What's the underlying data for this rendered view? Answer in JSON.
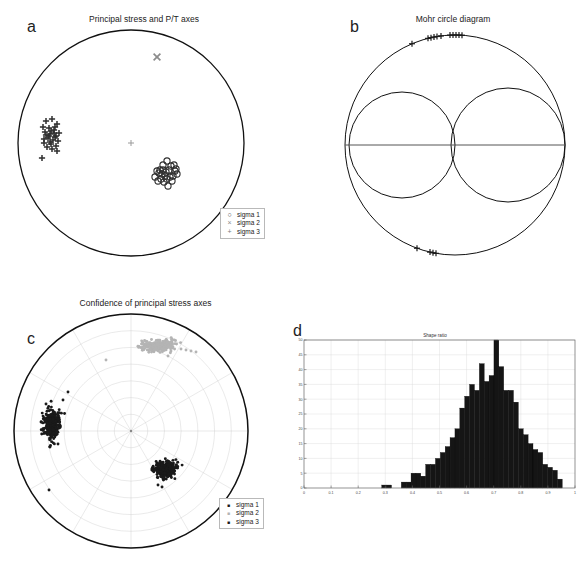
{
  "figure": {
    "panels": [
      {
        "letter": "a",
        "title": "Principal stress and P/T axes"
      },
      {
        "letter": "b",
        "title": "Mohr circle diagram"
      },
      {
        "letter": "c",
        "title": "Confidence of principal stress axes"
      },
      {
        "letter": "d",
        "title": "Shape ratio"
      }
    ]
  },
  "legend_a": {
    "items": [
      {
        "symbol": "○",
        "label": "sigma 1",
        "color": "#3a3a3a"
      },
      {
        "symbol": "×",
        "label": "sigma 2",
        "color": "#8c8c8c"
      },
      {
        "symbol": "+",
        "label": "sigma 3",
        "color": "#7a7a7a"
      }
    ]
  },
  "legend_c": {
    "items": [
      {
        "symbol": "■",
        "label": "sigma 1",
        "color": "#1a1a1a"
      },
      {
        "symbol": "■",
        "label": "sigma 2",
        "color": "#b4b4b4"
      },
      {
        "symbol": "■",
        "label": "sigma 3",
        "color": "#1a1a1a"
      }
    ]
  },
  "chart_data": [
    {
      "type": "scatter",
      "id": "panel-a-stereonet",
      "title": "Principal stress and P/T axes",
      "projection": "equal-area lower hemisphere stereonet",
      "grid": false,
      "legend_position": "bottom-right",
      "series": [
        {
          "name": "sigma 1",
          "marker": "open-circle",
          "color": "#2e2e2e",
          "points": [
            [
              155,
              177
            ],
            [
              160,
              170
            ],
            [
              163,
              165
            ],
            [
              167,
              161
            ],
            [
              171,
              166
            ],
            [
              175,
              171
            ],
            [
              166,
              172
            ],
            [
              162,
              174
            ],
            [
              158,
              181
            ],
            [
              164,
              182
            ],
            [
              170,
              177
            ],
            [
              174,
              165
            ],
            [
              168,
              186
            ],
            [
              172,
              181
            ],
            [
              177,
              174
            ],
            [
              159,
              173
            ],
            [
              165,
              176
            ],
            [
              169,
              170
            ],
            [
              173,
              176
            ],
            [
              161,
              179
            ],
            [
              157,
              171
            ],
            [
              176,
              169
            ],
            [
              167,
              179
            ],
            [
              163,
              170
            ]
          ]
        },
        {
          "name": "sigma 2",
          "marker": "cross-x",
          "color": "#8c8c8c",
          "points": [
            [
              157,
              57
            ]
          ]
        },
        {
          "name": "sigma 3",
          "marker": "plus",
          "color": "#2e2e2e",
          "points": [
            [
              46,
              121
            ],
            [
              52,
              119
            ],
            [
              57,
              124
            ],
            [
              43,
              127
            ],
            [
              49,
              128
            ],
            [
              54,
              130
            ],
            [
              59,
              133
            ],
            [
              45,
              132
            ],
            [
              50,
              134
            ],
            [
              55,
              137
            ],
            [
              48,
              138
            ],
            [
              53,
              140
            ],
            [
              58,
              141
            ],
            [
              44,
              143
            ],
            [
              51,
              144
            ],
            [
              56,
              146
            ],
            [
              47,
              147
            ],
            [
              52,
              149
            ],
            [
              57,
              151
            ],
            [
              42,
              158
            ],
            [
              49,
              136
            ],
            [
              54,
              133
            ],
            [
              46,
              135
            ],
            [
              51,
              131
            ],
            [
              55,
              127
            ],
            [
              50,
              142
            ],
            [
              44,
              139
            ],
            [
              56,
              136
            ]
          ]
        }
      ],
      "centroid_marker": {
        "symbol": "+",
        "color": "#9a9a9a",
        "point": [
          131,
          143
        ]
      }
    },
    {
      "type": "scatter",
      "id": "panel-b-mohr",
      "title": "Mohr circle diagram",
      "description": "Mohr circle with outer circle and two internal circles, data plotted as plus markers on outer arcs",
      "outer_circle": {
        "cx": 455,
        "cy": 145,
        "r": 110
      },
      "inner_circles": [
        {
          "cx": 402,
          "cy": 145,
          "r": 53
        },
        {
          "cx": 508,
          "cy": 145,
          "r": 57
        }
      ],
      "axis_line": {
        "x1": 345,
        "y1": 145,
        "x2": 565,
        "y2": 145
      },
      "markers": {
        "symbol": "plus",
        "color": "#1a1a1a",
        "upper_arc_x": [
          412,
          428,
          431,
          434,
          437,
          441,
          450,
          453,
          456,
          459,
          462
        ],
        "lower_arc_x": [
          417,
          430,
          433,
          436
        ]
      }
    },
    {
      "type": "scatter",
      "id": "panel-c-confidence",
      "title": "Confidence of principal stress axes",
      "projection": "equal-area stereonet with polar grid",
      "grid": true,
      "grid_color": "#cfcfcf",
      "grid_circles": 7,
      "grid_spokes": 12,
      "legend_position": "bottom-right",
      "series": [
        {
          "name": "sigma 1",
          "marker": "filled-dot",
          "color": "#1a1a1a",
          "cluster_center": [
            165,
            469
          ],
          "cluster_rx": 14,
          "cluster_ry": 9,
          "n_points": 260,
          "outliers": [
            [
              158,
              485
            ],
            [
              162,
              487
            ]
          ]
        },
        {
          "name": "sigma 2",
          "marker": "filled-dot",
          "color": "#b4b4b4",
          "cluster_center": [
            158,
            346
          ],
          "cluster_rx": 20,
          "cluster_ry": 6,
          "n_points": 260,
          "outliers": [
            [
              181,
              349
            ],
            [
              186,
              350
            ],
            [
              191,
              351
            ],
            [
              196,
              352
            ],
            [
              168,
              356
            ],
            [
              106,
              360
            ]
          ]
        },
        {
          "name": "sigma 3",
          "marker": "filled-dot",
          "color": "#1a1a1a",
          "cluster_center": [
            52,
            424
          ],
          "cluster_rx": 9,
          "cluster_ry": 17,
          "n_points": 300,
          "outliers": [
            [
              68,
              392
            ],
            [
              63,
              400
            ],
            [
              58,
              444
            ],
            [
              50,
              447
            ],
            [
              46,
              404
            ],
            [
              49,
              490
            ]
          ]
        }
      ]
    },
    {
      "type": "bar",
      "id": "panel-d-shape-ratio",
      "title": "Shape ratio",
      "xlabel": "",
      "ylabel": "",
      "xlim": [
        0,
        1
      ],
      "ylim": [
        0,
        50
      ],
      "xticks": [
        0,
        0.1,
        0.2,
        0.3,
        0.4,
        0.5,
        0.6,
        0.7,
        0.8,
        0.9,
        1
      ],
      "xticklabels": [
        "0",
        "0.1",
        "0.2",
        "0.3",
        "0.4",
        "0.5",
        "0.6",
        "0.7",
        "0.8",
        "0.9",
        "1"
      ],
      "yticks": [
        0,
        5,
        10,
        15,
        20,
        25,
        30,
        35,
        40,
        45,
        50
      ],
      "yticklabels": [
        "0",
        "5",
        "10",
        "15",
        "20",
        "25",
        "30",
        "35",
        "40",
        "45",
        "50"
      ],
      "grid": true,
      "bar_color": "#151515",
      "bin_width": 0.018,
      "categories": [
        0.296,
        0.314,
        0.332,
        0.35,
        0.368,
        0.386,
        0.404,
        0.422,
        0.44,
        0.458,
        0.476,
        0.494,
        0.512,
        0.53,
        0.548,
        0.566,
        0.584,
        0.602,
        0.62,
        0.638,
        0.656,
        0.674,
        0.692,
        0.71,
        0.728,
        0.746,
        0.764,
        0.782,
        0.8,
        0.818,
        0.836,
        0.854,
        0.872,
        0.89,
        0.908,
        0.926,
        0.944
      ],
      "values": [
        1,
        1,
        0,
        0,
        2,
        2,
        5,
        5,
        4,
        8,
        8,
        10,
        12,
        14,
        17,
        20,
        27,
        31,
        35,
        33,
        42,
        36,
        38,
        50,
        41,
        33,
        33,
        29,
        20,
        18,
        15,
        13,
        12,
        8,
        7,
        6,
        3
      ]
    }
  ]
}
